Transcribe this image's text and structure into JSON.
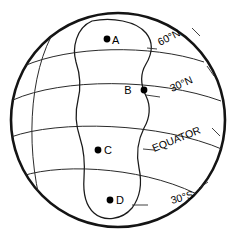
{
  "figure": {
    "type": "map-diagram",
    "background_color": "#ffffff",
    "line_color": "#1a1a1a"
  },
  "globe": {
    "outline_name": "sphere-outline",
    "center_x": 118,
    "center_y": 120,
    "radius": 108
  },
  "latitudes": [
    {
      "id": "lat-60n",
      "label": "60°N",
      "label_x": 160,
      "label_y": 46,
      "rotation": -27
    },
    {
      "id": "lat-30n",
      "label": "30°N",
      "label_x": 172,
      "label_y": 92,
      "rotation": -24
    },
    {
      "id": "lat-equator",
      "label": "EQUATOR",
      "label_x": 154,
      "label_y": 152,
      "rotation": -22
    },
    {
      "id": "lat-30s",
      "label": "30°S",
      "label_x": 172,
      "label_y": 204,
      "rotation": -16
    }
  ],
  "points": [
    {
      "id": "point-a",
      "label": "A",
      "dot_x": 107,
      "dot_y": 39,
      "label_x": 112,
      "label_y": 44
    },
    {
      "id": "point-b",
      "label": "B",
      "dot_x": 144,
      "dot_y": 90,
      "label_x": 128,
      "label_y": 94
    },
    {
      "id": "point-c",
      "label": "C",
      "dot_x": 98,
      "dot_y": 150,
      "label_x": 104,
      "label_y": 154
    },
    {
      "id": "point-d",
      "label": "D",
      "dot_x": 110,
      "dot_y": 200,
      "label_x": 116,
      "label_y": 204
    }
  ]
}
